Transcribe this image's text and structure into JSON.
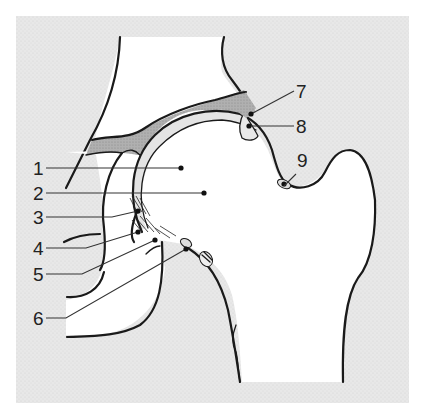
{
  "figure": {
    "colors": {
      "background_frame": "#e6e6e6",
      "bone": "#ffffff",
      "cartilage_labrum_fill": "#aaaaaa",
      "synovium_fill": "#e0e0e0",
      "outline": "#1a1a1a"
    },
    "labels": [
      {
        "id": "1",
        "text": "1"
      },
      {
        "id": "2",
        "text": "2"
      },
      {
        "id": "3",
        "text": "3"
      },
      {
        "id": "4",
        "text": "4"
      },
      {
        "id": "5",
        "text": "5"
      },
      {
        "id": "6",
        "text": "6"
      },
      {
        "id": "7",
        "text": "7"
      },
      {
        "id": "8",
        "text": "8"
      },
      {
        "id": "9",
        "text": "9"
      }
    ]
  }
}
